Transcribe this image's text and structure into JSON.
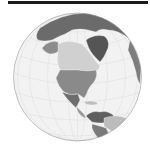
{
  "map": {
    "projection": "orthographic",
    "center_region": "North America",
    "colors": {
      "ocean": "#f2f2f2",
      "outline": "#9a9a9a",
      "graticule": "#d8d8d8",
      "topbar": "#1a1a1a"
    },
    "regions": [
      {
        "id": "russia-arctic",
        "name": "Russia / Arctic",
        "color": "#6b6b6b"
      },
      {
        "id": "greenland",
        "name": "Greenland",
        "color": "#555555"
      },
      {
        "id": "alaska",
        "name": "Alaska",
        "color": "#8c8c8c"
      },
      {
        "id": "canada",
        "name": "Canada",
        "color": "#d0d0d0"
      },
      {
        "id": "usa",
        "name": "United States",
        "color": "#8a8a8a"
      },
      {
        "id": "mexico",
        "name": "Mexico",
        "color": "#6e6e6e"
      },
      {
        "id": "central-america",
        "name": "Central America",
        "color": "#9a9a9a"
      },
      {
        "id": "caribbean",
        "name": "Caribbean",
        "color": "#bdbdbd"
      },
      {
        "id": "colombia-venezuela",
        "name": "Northern South America",
        "color": "#5f5f5f"
      },
      {
        "id": "brazil",
        "name": "Brazil",
        "color": "#bcbcbc"
      },
      {
        "id": "peru",
        "name": "Peru",
        "color": "#7a7a7a"
      },
      {
        "id": "europe-edge",
        "name": "Europe / Africa edge",
        "color": "#7d7d7d"
      }
    ]
  }
}
